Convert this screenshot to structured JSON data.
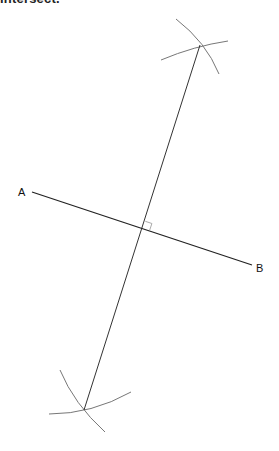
{
  "header": {
    "clipped_caption": "intersect."
  },
  "diagram": {
    "colors": {
      "segment": "#222222",
      "bisector": "#333333",
      "arcs": "#777777",
      "right_angle_marker": "#aaaaaa"
    },
    "points": {
      "A": {
        "label": "A",
        "x": 32,
        "y": 192
      },
      "B": {
        "label": "B",
        "x": 252,
        "y": 265
      },
      "top_intersection": {
        "x": 200,
        "y": 45
      },
      "bottom_intersection": {
        "x": 84,
        "y": 410
      },
      "midpoint": {
        "x": 143,
        "y": 228
      }
    },
    "labels": [
      {
        "id": "A",
        "text": "A",
        "x": 18,
        "y": 196
      },
      {
        "id": "B",
        "text": "B",
        "x": 256,
        "y": 272
      }
    ],
    "arcs": [
      {
        "name": "top-arc-from-A",
        "from": [
          176,
          19
        ],
        "to": [
          219,
          74
        ]
      },
      {
        "name": "top-arc-from-B",
        "from": [
          161,
          60
        ],
        "to": [
          228,
          41
        ]
      },
      {
        "name": "bottom-arc-from-A",
        "from": [
          60,
          370
        ],
        "to": [
          105,
          432
        ]
      },
      {
        "name": "bottom-arc-from-B",
        "from": [
          49,
          414
        ],
        "to": [
          131,
          392
        ]
      }
    ],
    "right_angle_marker": true
  }
}
